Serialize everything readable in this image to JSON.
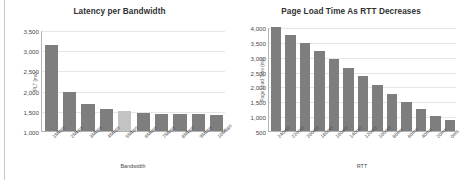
{
  "document": {
    "kind": "two-panel-bar-chart-figure",
    "background_color": "#ffffff"
  },
  "palette": {
    "bar": "#7e7e7e",
    "bar_highlight": "#c3c3c3",
    "axis_line": "#b4b4b4",
    "gridline": "#e6e6e6",
    "text": "#4a4a4a",
    "title_text": "#303030"
  },
  "chart_data": [
    {
      "id": "latency-per-bandwidth",
      "type": "bar",
      "title": "Latency per Bandwidth",
      "xlabel": "Bandwidth",
      "ylabel": "PLT (ms)",
      "categories": [
        "1Mbps",
        "2Mbps",
        "3Mbps",
        "4Mbps",
        "5Mbps",
        "6Mbps",
        "7Mbps",
        "8Mbps",
        "9Mbps",
        "10Mbps"
      ],
      "values": [
        3120,
        1970,
        1670,
        1540,
        1490,
        1440,
        1430,
        1420,
        1410,
        1390
      ],
      "highlight_index": 4,
      "ylim": [
        1000,
        3500
      ],
      "ytick_values": [
        1000,
        1500,
        2000,
        2500,
        3000,
        3500
      ],
      "ytick_labels": [
        "1,000",
        "1,500",
        "2,000",
        "2,500",
        "3,000",
        "3,500"
      ],
      "grid": true,
      "legend": false,
      "bar_color": "#7e7e7e",
      "highlight_color": "#c3c3c3"
    },
    {
      "id": "page-load-time-as-rtt-decreases",
      "type": "bar",
      "title": "Page Load Time As RTT Decreases",
      "xlabel": "RTT",
      "ylabel": "Page Load Time (ms)",
      "categories": [
        "240ms",
        "220ms",
        "200ms",
        "180ms",
        "160ms",
        "140ms",
        "120ms",
        "100ms",
        "80ms",
        "60ms",
        "40ms",
        "20ms",
        "0ms"
      ],
      "values": [
        4000,
        3730,
        3450,
        3200,
        2930,
        2620,
        2340,
        2050,
        1760,
        1480,
        1240,
        1020,
        860
      ],
      "highlight_index": null,
      "ylim": [
        500,
        4000
      ],
      "ytick_values": [
        500,
        1000,
        1500,
        2000,
        2500,
        3000,
        3500,
        4000
      ],
      "ytick_labels": [
        "500",
        "1,000",
        "1,500",
        "2,000",
        "2,500",
        "3,000",
        "3,500",
        "4,000"
      ],
      "grid": true,
      "legend": false,
      "bar_color": "#7e7e7e",
      "highlight_color": "#c3c3c3"
    }
  ]
}
